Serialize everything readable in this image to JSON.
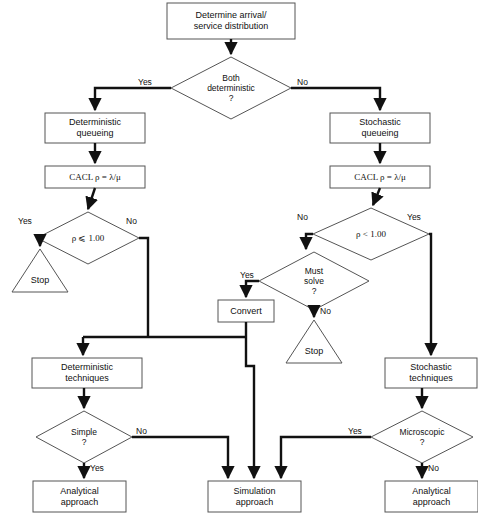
{
  "diagram": {
    "background_color": "#ffffff",
    "line_color": "#111111",
    "text_color": "#111111"
  },
  "nodes": {
    "start_box": {
      "label": "Determine arrival/\nservice distribution",
      "shape": "process"
    },
    "both_deterministic": {
      "label": "Both\ndeterministic\n?",
      "shape": "decision"
    },
    "deterministic_queueing": {
      "label": "Deterministic\nqueueing",
      "shape": "process"
    },
    "stochastic_queueing": {
      "label": "Stochastic\nqueueing",
      "shape": "process"
    },
    "calc_rho_left": {
      "label": "CACL ρ = λ/μ",
      "shape": "process"
    },
    "calc_rho_right": {
      "label": "CACL ρ = λ/μ",
      "shape": "process"
    },
    "rho_le_one": {
      "label": "ρ ⩽ 1.00",
      "shape": "decision"
    },
    "rho_lt_one": {
      "label": "ρ < 1.00",
      "shape": "decision"
    },
    "stop_left": {
      "label": "Stop",
      "shape": "terminator"
    },
    "must_solve": {
      "label": "Must\nsolve\n?",
      "shape": "decision"
    },
    "convert": {
      "label": "Convert",
      "shape": "process"
    },
    "stop_middle": {
      "label": "Stop",
      "shape": "terminator"
    },
    "deterministic_techniques": {
      "label": "Deterministic\ntechniques",
      "shape": "process"
    },
    "stochastic_techniques": {
      "label": "Stochastic\ntechniques",
      "shape": "process"
    },
    "simple": {
      "label": "Simple\n?",
      "shape": "decision"
    },
    "microscopic": {
      "label": "Microscopic\n?",
      "shape": "decision"
    },
    "analytical_left": {
      "label": "Analytical\napproach",
      "shape": "process"
    },
    "simulation": {
      "label": "Simulation\napproach",
      "shape": "process"
    },
    "analytical_right": {
      "label": "Analytical\napproach",
      "shape": "process"
    }
  },
  "edge_labels": {
    "both_deterministic_yes": "Yes",
    "both_deterministic_no": "No",
    "rho_le_one_yes": "Yes",
    "rho_le_one_no": "No",
    "rho_lt_one_no": "No",
    "rho_lt_one_yes": "Yes",
    "must_solve_yes": "Yes",
    "must_solve_no": "No",
    "simple_no": "No",
    "simple_yes": "Yes",
    "microscopic_yes": "Yes",
    "microscopic_no": "No"
  }
}
